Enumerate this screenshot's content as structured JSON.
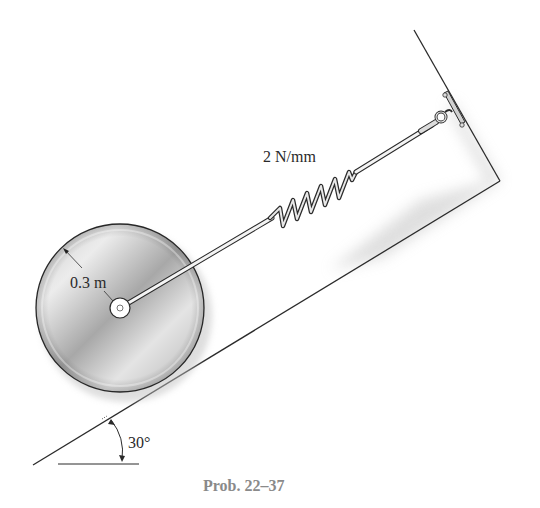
{
  "figure": {
    "spring_label": "2 N/mm",
    "radius_label": "0.3 m",
    "angle_label": "30°",
    "caption": "Prob. 22–37"
  },
  "elements": {
    "disk": {
      "shape": "uniform-disk",
      "radius": "0.3 m"
    },
    "spring": {
      "stiffness": "2 N/mm"
    },
    "incline": {
      "angle": "30°"
    },
    "support": {
      "type": "wall-bracket-with-eye-hook"
    }
  },
  "colors": {
    "line": "#2b2b2b",
    "disk_light": "#e6e6e6",
    "disk_dark": "#9c9c9c",
    "caption": "#8a8a8a",
    "shadow": "#d9d9d9"
  }
}
